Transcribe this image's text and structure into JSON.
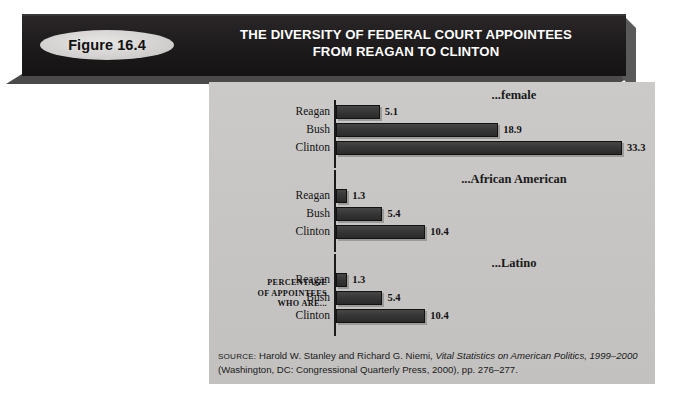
{
  "figure": {
    "badge_label": "Figure 16.4",
    "title_line1": "THE DIVERSITY OF FEDERAL COURT APPOINTEES",
    "title_line2": "FROM REAGAN TO CLINTON"
  },
  "axis_caption": {
    "line1": "PERCENTAGE",
    "line2": "OF APPOINTEES",
    "line3": "WHO ARE..."
  },
  "source": {
    "label": "SOURCE:",
    "text_before_italic": " Harold W. Stanley and Richard G. Niemi, ",
    "italic_title": "Vital Statistics on American Politics, 1999–2000",
    "text_after_italic": " (Washington, DC: Congressional Quarterly Press, 2000), pp. 276–277."
  },
  "colors": {
    "banner": "#231f20",
    "panel": "#c8c7c5",
    "bar": "#3a3a3a",
    "badge": "#d6d4d2",
    "text": "#121212"
  },
  "chart_data": {
    "type": "bar",
    "orientation": "horizontal",
    "title": "THE DIVERSITY OF FEDERAL COURT APPOINTEES FROM REAGAN TO CLINTON",
    "xlabel": "",
    "ylabel": "PERCENTAGE OF APPOINTEES WHO ARE...",
    "categories": [
      "Reagan",
      "Bush",
      "Clinton"
    ],
    "xlim": [
      0,
      33.3
    ],
    "grid": false,
    "legend": "none",
    "groups": [
      {
        "label": "...female",
        "bars": [
          {
            "category": "Reagan",
            "value": 5.1,
            "value_label": "5.1"
          },
          {
            "category": "Bush",
            "value": 18.9,
            "value_label": "18.9"
          },
          {
            "category": "Clinton",
            "value": 33.3,
            "value_label": "33.3"
          }
        ]
      },
      {
        "label": "...African American",
        "bars": [
          {
            "category": "Reagan",
            "value": 1.3,
            "value_label": "1.3"
          },
          {
            "category": "Bush",
            "value": 5.4,
            "value_label": "5.4"
          },
          {
            "category": "Clinton",
            "value": 10.4,
            "value_label": "10.4"
          }
        ]
      },
      {
        "label": "...Latino",
        "bars": [
          {
            "category": "Reagan",
            "value": 1.3,
            "value_label": "1.3"
          },
          {
            "category": "Bush",
            "value": 5.4,
            "value_label": "5.4"
          },
          {
            "category": "Clinton",
            "value": 10.4,
            "value_label": "10.4"
          }
        ]
      }
    ]
  }
}
